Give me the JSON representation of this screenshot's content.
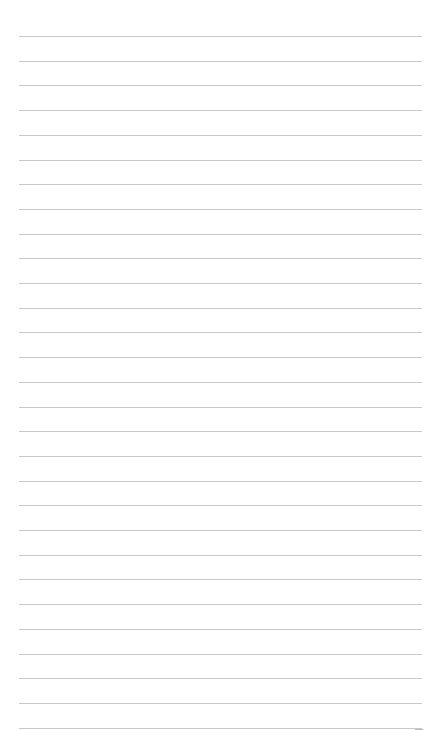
{
  "page": {
    "type": "blank lined paper",
    "line_count": 29,
    "first_line_y": 36,
    "line_spacing": 24.7,
    "line_color": "#c9c9c9",
    "background_color": "#ffffff",
    "text": ""
  }
}
